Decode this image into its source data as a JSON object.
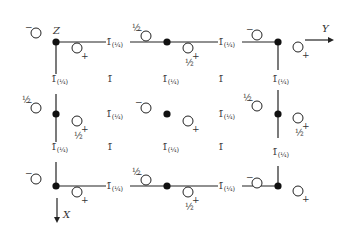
{
  "diagram": {
    "type": "space-group symmetry diagram",
    "axes": {
      "z_label": "Z",
      "y_label": "Y",
      "x_label": "X"
    },
    "symbols": {
      "inversion": "1̄",
      "inversion_quarter": "1̄(¼)",
      "half": "½",
      "minus": "−",
      "plus": "+",
      "half_minus": "½−",
      "half_plus": "½+"
    },
    "lattice_points": [
      {
        "id": "tl",
        "x": 56,
        "y": 42
      },
      {
        "id": "tm",
        "x": 167,
        "y": 42
      },
      {
        "id": "tr",
        "x": 278,
        "y": 42
      },
      {
        "id": "ml",
        "x": 56,
        "y": 114
      },
      {
        "id": "mc",
        "x": 167,
        "y": 114
      },
      {
        "id": "mr",
        "x": 278,
        "y": 114
      },
      {
        "id": "bl",
        "x": 56,
        "y": 186
      },
      {
        "id": "bm",
        "x": 167,
        "y": 186
      },
      {
        "id": "br",
        "x": 278,
        "y": 186
      }
    ],
    "atoms": [
      {
        "x": 36,
        "y": 33,
        "sign": "−",
        "frac": ""
      },
      {
        "x": 77,
        "y": 48,
        "sign": "+",
        "frac": ""
      },
      {
        "x": 146,
        "y": 36,
        "sign": "−",
        "frac": "½"
      },
      {
        "x": 188,
        "y": 48,
        "sign": "+",
        "frac": "½"
      },
      {
        "x": 257,
        "y": 35,
        "sign": "−",
        "frac": ""
      },
      {
        "x": 298,
        "y": 47,
        "sign": "+",
        "frac": ""
      },
      {
        "x": 36,
        "y": 108,
        "sign": "−",
        "frac": "½"
      },
      {
        "x": 77,
        "y": 121,
        "sign": "+",
        "frac": "½"
      },
      {
        "x": 146,
        "y": 108,
        "sign": "−",
        "frac": ""
      },
      {
        "x": 188,
        "y": 121,
        "sign": "+",
        "frac": ""
      },
      {
        "x": 257,
        "y": 106,
        "sign": "−",
        "frac": "½"
      },
      {
        "x": 298,
        "y": 118,
        "sign": "+",
        "frac": "½"
      },
      {
        "x": 36,
        "y": 179,
        "sign": "−",
        "frac": ""
      },
      {
        "x": 77,
        "y": 192,
        "sign": "+",
        "frac": ""
      },
      {
        "x": 146,
        "y": 180,
        "sign": "−",
        "frac": "½"
      },
      {
        "x": 188,
        "y": 192,
        "sign": "+",
        "frac": "½"
      },
      {
        "x": 257,
        "y": 183,
        "sign": "−",
        "frac": ""
      },
      {
        "x": 298,
        "y": 191,
        "sign": "+",
        "frac": ""
      }
    ],
    "inversion_labels": [
      {
        "x": 110,
        "y": 45,
        "text": "1̄",
        "sub": "(¼)"
      },
      {
        "x": 222,
        "y": 45,
        "text": "1̄",
        "sub": "(¼)"
      },
      {
        "x": 55,
        "y": 82,
        "text": "1̄",
        "sub": "(¼)"
      },
      {
        "x": 111,
        "y": 82,
        "text": "1̄",
        "sub": ""
      },
      {
        "x": 166,
        "y": 82,
        "text": "1̄",
        "sub": "(¼)"
      },
      {
        "x": 222,
        "y": 82,
        "text": "1̄",
        "sub": ""
      },
      {
        "x": 276,
        "y": 82,
        "text": "1̄",
        "sub": "(¼)"
      },
      {
        "x": 110,
        "y": 117,
        "text": "1̄",
        "sub": "(¼)"
      },
      {
        "x": 222,
        "y": 117,
        "text": "1̄",
        "sub": "(¼)"
      },
      {
        "x": 55,
        "y": 150,
        "text": "1̄",
        "sub": "(¼)"
      },
      {
        "x": 111,
        "y": 150,
        "text": "1̄",
        "sub": ""
      },
      {
        "x": 166,
        "y": 150,
        "text": "1̄",
        "sub": "(¼)"
      },
      {
        "x": 222,
        "y": 150,
        "text": "1̄",
        "sub": ""
      },
      {
        "x": 276,
        "y": 155,
        "text": "1̄",
        "sub": "(¼)"
      },
      {
        "x": 110,
        "y": 189,
        "text": "1̄",
        "sub": "(¼)"
      },
      {
        "x": 222,
        "y": 189,
        "text": "1̄",
        "sub": "(¼)"
      }
    ]
  }
}
